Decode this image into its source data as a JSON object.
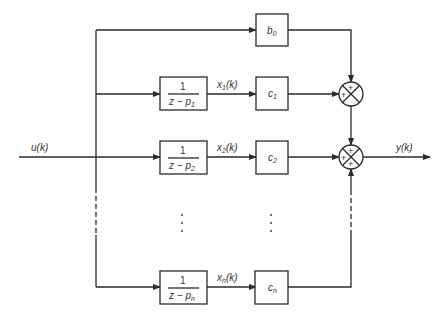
{
  "diagram": {
    "type": "block-diagram",
    "input_label": "u(k)",
    "output_label": "y(k)",
    "feedthrough": {
      "gain": "b",
      "gain_sub": "0"
    },
    "branches": [
      {
        "tf_num": "1",
        "tf_den": "z − p",
        "tf_sub": "1",
        "state": "x",
        "state_sub": "1",
        "state_arg": "(k)",
        "gain": "c",
        "gain_sub": "1"
      },
      {
        "tf_num": "1",
        "tf_den": "z − p",
        "tf_sub": "2",
        "state": "x",
        "state_sub": "2",
        "state_arg": "(k)",
        "gain": "c",
        "gain_sub": "2"
      },
      {
        "tf_num": "1",
        "tf_den": "z − p",
        "tf_sub": "n",
        "state": "x",
        "state_sub": "n",
        "state_arg": "(k)",
        "gain": "c",
        "gain_sub": "n"
      }
    ],
    "ellipsis": "⋮",
    "summing_junctions": [
      {
        "signs": [
          "+",
          "+"
        ]
      },
      {
        "signs": [
          "+",
          "+",
          "+"
        ]
      }
    ]
  }
}
